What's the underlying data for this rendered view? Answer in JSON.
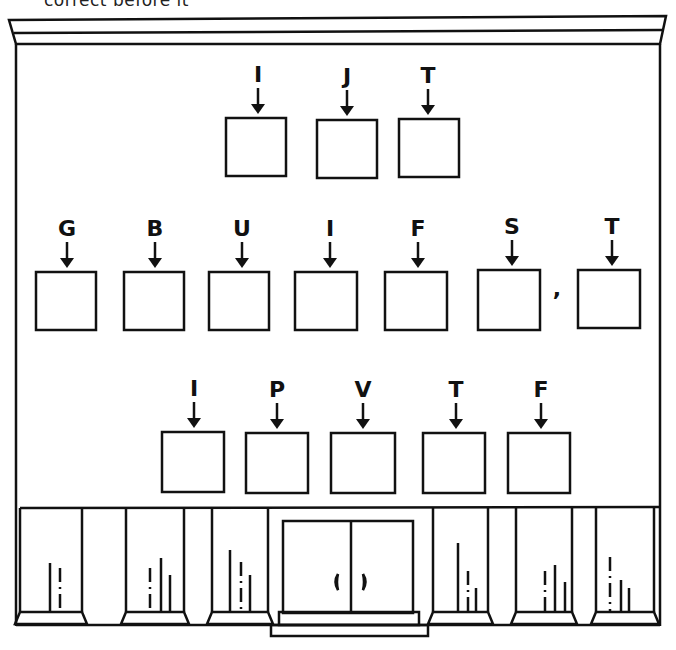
{
  "header_text": "correct before it",
  "puzzle": {
    "row1": [
      {
        "clue": "I",
        "x": 258,
        "box": [
          226,
          118,
          60,
          58
        ]
      },
      {
        "clue": "J",
        "x": 347,
        "box": [
          317,
          120,
          60,
          58
        ]
      },
      {
        "clue": "T",
        "x": 428,
        "box": [
          399,
          119,
          60,
          58
        ]
      }
    ],
    "row2": [
      {
        "clue": "G",
        "x": 67,
        "box": [
          36,
          272,
          60,
          58
        ]
      },
      {
        "clue": "B",
        "x": 155,
        "box": [
          124,
          272,
          60,
          58
        ]
      },
      {
        "clue": "U",
        "x": 242,
        "box": [
          209,
          272,
          60,
          58
        ]
      },
      {
        "clue": "I",
        "x": 330,
        "box": [
          295,
          272,
          62,
          58
        ]
      },
      {
        "clue": "F",
        "x": 418,
        "box": [
          385,
          272,
          62,
          58
        ]
      },
      {
        "clue": "S",
        "x": 512,
        "box": [
          478,
          270,
          62,
          60
        ]
      },
      {
        "clue": "T",
        "x": 612,
        "box": [
          578,
          270,
          62,
          58
        ]
      }
    ],
    "comma": ",",
    "row3": [
      {
        "clue": "I",
        "x": 194,
        "box": [
          162,
          432,
          62,
          60
        ]
      },
      {
        "clue": "P",
        "x": 277,
        "box": [
          246,
          433,
          62,
          60
        ]
      },
      {
        "clue": "V",
        "x": 363,
        "box": [
          331,
          433,
          64,
          60
        ]
      },
      {
        "clue": "T",
        "x": 456,
        "box": [
          423,
          433,
          62,
          60
        ]
      },
      {
        "clue": "F",
        "x": 541,
        "box": [
          508,
          433,
          62,
          60
        ]
      }
    ]
  }
}
